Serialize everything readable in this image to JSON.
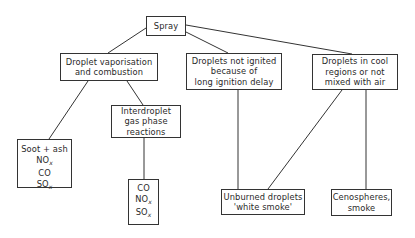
{
  "diagram": {
    "nodes": {
      "spray": {
        "lines": [
          "Spray"
        ]
      },
      "vaporisation": {
        "lines": [
          "Droplet vaporisation",
          "and combustion"
        ]
      },
      "not_ignited": {
        "lines": [
          "Droplets not ignited",
          "because of",
          "long ignition delay"
        ]
      },
      "cool_regions": {
        "lines": [
          "Droplets in cool",
          "regions or not",
          "mixed with air"
        ]
      },
      "interdroplet": {
        "lines": [
          "Interdroplet",
          "gas phase",
          "reactions"
        ]
      },
      "soot": {
        "lines": [
          "Soot + ash",
          "NO",
          "CO",
          "SO"
        ],
        "subscripts": {
          "1": "x",
          "3": "x"
        }
      },
      "gas_products": {
        "lines": [
          "CO",
          "NO",
          "SO"
        ],
        "subscripts": {
          "1": "x",
          "2": "x"
        }
      },
      "unburned": {
        "lines": [
          "Unburned droplets",
          "'white smoke'"
        ]
      },
      "cenospheres": {
        "lines": [
          "Cenospheres,",
          "smoke"
        ]
      }
    },
    "edges": [
      [
        "spray",
        "vaporisation"
      ],
      [
        "spray",
        "not_ignited"
      ],
      [
        "spray",
        "cool_regions"
      ],
      [
        "vaporisation",
        "soot"
      ],
      [
        "vaporisation",
        "interdroplet"
      ],
      [
        "interdroplet",
        "gas_products"
      ],
      [
        "not_ignited",
        "unburned"
      ],
      [
        "cool_regions",
        "unburned"
      ],
      [
        "cool_regions",
        "cenospheres"
      ]
    ]
  }
}
